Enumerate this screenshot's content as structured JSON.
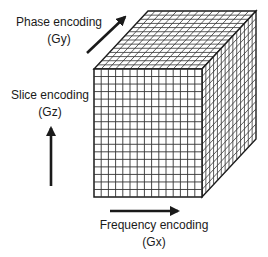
{
  "diagram": {
    "type": "k-space 3D encoding cube",
    "labels": {
      "phase": {
        "line1": "Phase encoding",
        "line2": "(Gy)"
      },
      "slice": {
        "line1": "Slice encoding",
        "line2": "(Gz)"
      },
      "frequency": {
        "line1": "Frequency encoding",
        "line2": "(Gx)"
      }
    },
    "cube": {
      "front_columns": 15,
      "front_rows": 17,
      "depth_divisions": 14
    },
    "colors": {
      "line": "#1a1a1a",
      "grid": "#333333",
      "background": "#ffffff"
    }
  }
}
